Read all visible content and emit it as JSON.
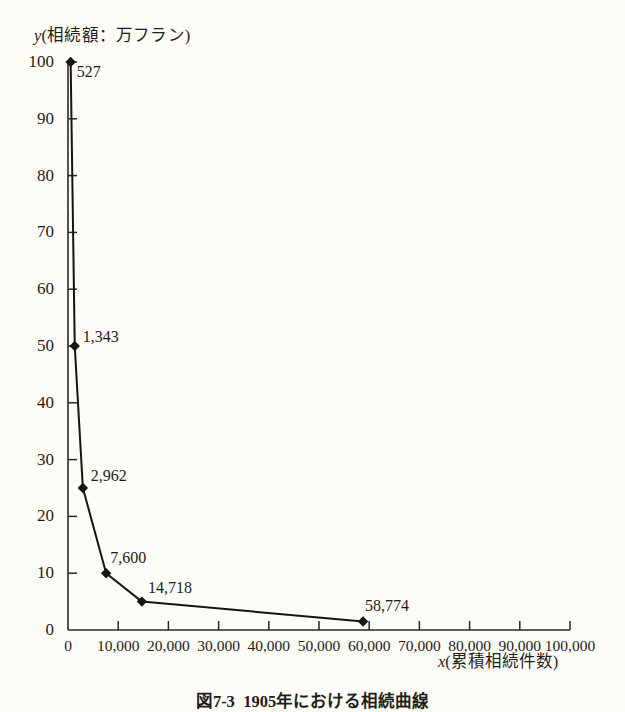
{
  "chart_data": {
    "type": "line",
    "xlabel": "x(累積相続件数)",
    "ylabel": "y(相続額：万フラン)",
    "xlim": [
      0,
      100000
    ],
    "ylim": [
      0,
      100
    ],
    "grid": false,
    "legend": null,
    "x": [
      527,
      1343,
      2962,
      7600,
      14718,
      58774
    ],
    "y": [
      100,
      50,
      25,
      10,
      5,
      1.5
    ],
    "point_labels": [
      "527",
      "1,343",
      "2,962",
      "7,600",
      "14,718",
      "58,774"
    ],
    "series": [
      {
        "name": "相続曲線",
        "points": [
          {
            "x": 527,
            "y": 100,
            "label": "527"
          },
          {
            "x": 1343,
            "y": 50,
            "label": "1,343"
          },
          {
            "x": 2962,
            "y": 25,
            "label": "2,962"
          },
          {
            "x": 7600,
            "y": 10,
            "label": "7,600"
          },
          {
            "x": 14718,
            "y": 5,
            "label": "14,718"
          },
          {
            "x": 58774,
            "y": 1.5,
            "label": "58,774"
          }
        ]
      }
    ],
    "xticks": [
      0,
      10000,
      20000,
      30000,
      40000,
      50000,
      60000,
      70000,
      80000,
      90000,
      100000
    ],
    "xticklabels": [
      "0",
      "10,000",
      "20,000",
      "30,000",
      "40,000",
      "50,000",
      "60,000",
      "70,000",
      "80,000",
      "90,000",
      "100,000"
    ],
    "yticks": [
      0,
      10,
      20,
      30,
      40,
      50,
      60,
      70,
      80,
      90,
      100
    ],
    "yticklabels": [
      "0",
      "10",
      "20",
      "30",
      "40",
      "50",
      "60",
      "70",
      "80",
      "90",
      "100"
    ],
    "line_color": "#171510",
    "marker": "diamond",
    "marker_color": "#171510",
    "background_color": "#fdfcf7"
  },
  "axis": {
    "y_title_symbol": "y",
    "y_title_rest": "(相続額：万フラン)",
    "x_title_symbol": "x",
    "x_title_rest": "(累積相続件数)"
  },
  "caption": {
    "number": "図7-3",
    "text": "1905年における相続曲線"
  }
}
